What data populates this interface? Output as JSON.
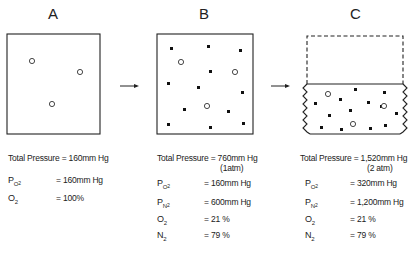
{
  "panels": [
    {
      "label": "A",
      "total_pressure": "Total Pressure = 160mm Hg",
      "total_pressure_note": "",
      "rows": [
        {
          "symbol": "P",
          "sub": "O",
          "subsub": "2",
          "value": "= 160mm Hg"
        },
        {
          "symbol": "O",
          "sub": "2",
          "subsub": "",
          "value": "= 100%"
        }
      ],
      "container": "closed box",
      "molecules": {
        "oxygen_open_circles": 3,
        "nitrogen_dots": 0
      }
    },
    {
      "label": "B",
      "total_pressure": "Total Pressure = 760mm Hg",
      "total_pressure_note": "(1atm)",
      "rows": [
        {
          "symbol": "P",
          "sub": "O",
          "subsub": "2",
          "value": "= 160mm Hg"
        },
        {
          "symbol": "P",
          "sub": "N",
          "subsub": "2",
          "value": "= 600mm Hg"
        },
        {
          "symbol": "O",
          "sub": "2",
          "subsub": "",
          "value": "= 21 %"
        },
        {
          "symbol": "N",
          "sub": "2",
          "subsub": "",
          "value": "= 79 %"
        }
      ],
      "container": "closed box",
      "molecules": {
        "oxygen_open_circles": 3,
        "nitrogen_dots": 12
      }
    },
    {
      "label": "C",
      "total_pressure": "Total Pressure = 1,520mm Hg",
      "total_pressure_note": "(2 atm)",
      "rows": [
        {
          "symbol": "P",
          "sub": "O",
          "subsub": "2",
          "value": "= 320mm Hg"
        },
        {
          "symbol": "P",
          "sub": "N",
          "subsub": "2",
          "value": "= 1,200mm Hg"
        },
        {
          "symbol": "O",
          "sub": "2",
          "subsub": "",
          "value": "= 21 %"
        },
        {
          "symbol": "N",
          "sub": "2",
          "subsub": "",
          "value": "= 79 %"
        }
      ],
      "container": "compressed to half volume (dashed outline shows original volume)",
      "molecules": {
        "oxygen_open_circles": 3,
        "nitrogen_dots": 12
      }
    }
  ],
  "arrows": [
    "A-to-B",
    "B-to-C"
  ],
  "colors": {
    "line": "#222222",
    "background": "#ffffff"
  }
}
